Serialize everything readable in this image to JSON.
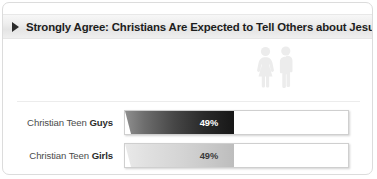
{
  "header": {
    "title": "Strongly Agree: Christians Are Expected to Tell Others about Jesus",
    "play_icon": "play-triangle-icon"
  },
  "illustration": {
    "female_icon": "female-silhouette-icon",
    "male_icon": "male-silhouette-icon",
    "color": "#ececec"
  },
  "chart_data": {
    "type": "bar",
    "orientation": "horizontal",
    "title": "Strongly Agree: Christians Are Expected to Tell Others about Jesus",
    "xlabel": "",
    "ylabel": "",
    "xlim": [
      0,
      100
    ],
    "grid": false,
    "legend": "none",
    "categories": [
      "Christian Teen Guys",
      "Christian Teen Girls"
    ],
    "values": [
      49,
      49
    ],
    "value_labels": [
      "49%",
      "49%"
    ],
    "series": [
      {
        "name": "Strongly Agree",
        "values": [
          49,
          49
        ]
      }
    ],
    "bars": [
      {
        "label_prefix": "Christian Teen ",
        "label_emphasis": "Guys",
        "value": 49,
        "value_label": "49%",
        "fill_style": "dark-gradient",
        "fill_from": "#8f8f8f",
        "fill_to": "#171717",
        "label_text_color": "#ffffff"
      },
      {
        "label_prefix": "Christian Teen ",
        "label_emphasis": "Girls",
        "value": 49,
        "value_label": "49%",
        "fill_style": "light-gradient",
        "fill_from": "#e9e9e9",
        "fill_to": "#bdbdbd",
        "label_text_color": "#3a3a3a"
      }
    ]
  },
  "colors": {
    "card_background": "#ffffff",
    "card_border": "#dcdcdc",
    "header_band": "#e8e8e8",
    "header_text": "#1d1d1d",
    "label_text": "#4b4b4b",
    "track_border": "#cfcfcf"
  }
}
